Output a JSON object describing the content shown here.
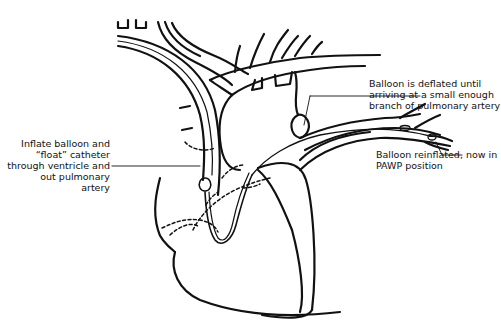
{
  "diagram": {
    "labels": {
      "inflate": [
        "Inflate balloon and",
        "“float” catheter",
        "through ventricle and",
        "out pulmonary",
        "artery"
      ],
      "deflated": [
        "Balloon is deflated until",
        "arriving at a small enough",
        "branch of pulmonary artery"
      ],
      "reinflated": [
        "Balloon reinflated, now in",
        "PAWP position"
      ]
    },
    "colors": {
      "line": "#111111",
      "background": "#ffffff"
    }
  }
}
